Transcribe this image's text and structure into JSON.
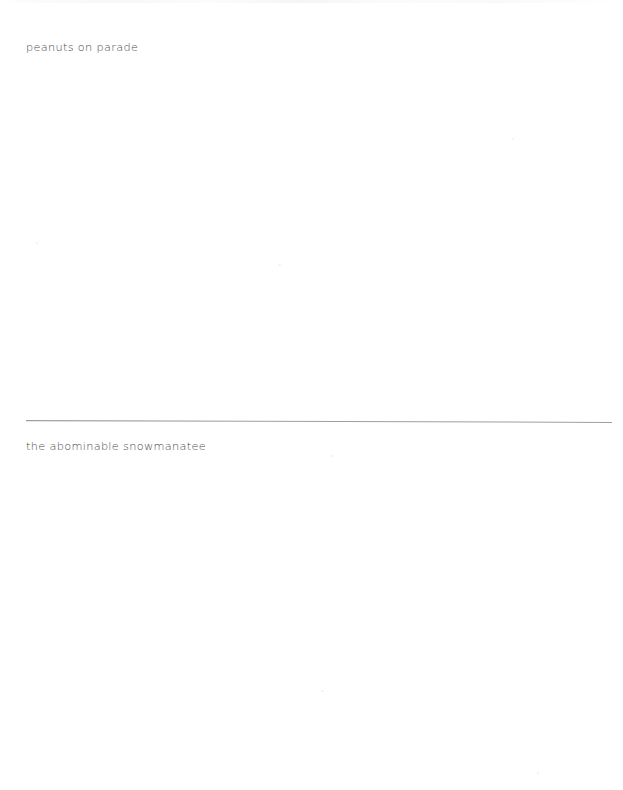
{
  "document": {
    "type": "scanned-page",
    "page_background": "#ffffff",
    "width": 623,
    "height": 790
  },
  "content": {
    "lines": [
      {
        "id": "line-top",
        "text": "peanuts on parade",
        "color": "#4b4b4d"
      },
      {
        "id": "line-bottom",
        "text": "the abominable snowmanatee",
        "color": "#4b4b4d"
      }
    ],
    "divider": {
      "name": "horizontal-rule",
      "color": "#9aa0a6",
      "description": "thin slightly slanted horizontal line"
    }
  }
}
